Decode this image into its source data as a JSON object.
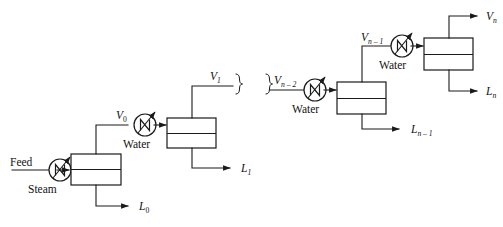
{
  "figure": {
    "kind": "process-flow-diagram",
    "width": 503,
    "height": 227,
    "background_color": "#ffffff",
    "line_color": "#1a1a1a",
    "liquid_fill_color": "#d6d6d6",
    "vessel_fill_color": "#ffffff"
  },
  "labels": {
    "feed": "Feed",
    "steam": "Steam",
    "water_1": "Water",
    "water_2": "Water",
    "water_3": "Water",
    "V0": "V",
    "V0_sub": "0",
    "V1": "V",
    "V1_sub": "1",
    "Vn2": "V",
    "Vn2_sub": "n – 2",
    "Vn1": "V",
    "Vn1_sub": "n – 1",
    "Vn": "V",
    "Vn_sub": "n",
    "L0": "L",
    "L0_sub": "0",
    "L1": "L",
    "L1_sub": "1",
    "Ln1": "L",
    "Ln1_sub": "n – 1",
    "Ln": "L",
    "Ln_sub": "n"
  },
  "streams": [
    {
      "id": "feed",
      "label": "Feed",
      "role": "inlet-liquid",
      "into": "heat-exchanger-steam"
    },
    {
      "id": "steam",
      "label": "Steam",
      "role": "heating-medium",
      "into": "heat-exchanger-steam"
    },
    {
      "id": "V0",
      "label": "V0",
      "role": "vapor-out",
      "from": "evaporator-1",
      "into": "heat-exchanger-1"
    },
    {
      "id": "L0",
      "label": "L0",
      "role": "liquid-out",
      "from": "evaporator-1"
    },
    {
      "id": "V1",
      "label": "V1",
      "role": "vapor-out",
      "from": "evaporator-2"
    },
    {
      "id": "L1",
      "label": "L1",
      "role": "liquid-out",
      "from": "evaporator-2"
    },
    {
      "id": "Vn2",
      "label": "Vn-2",
      "role": "vapor-in",
      "into": "heat-exchanger-2"
    },
    {
      "id": "Vn1",
      "label": "Vn-1",
      "role": "vapor-out",
      "from": "evaporator-3",
      "into": "heat-exchanger-3"
    },
    {
      "id": "Ln1",
      "label": "Ln-1",
      "role": "liquid-out",
      "from": "evaporator-3"
    },
    {
      "id": "Vn",
      "label": "Vn",
      "role": "vapor-out",
      "from": "evaporator-4"
    },
    {
      "id": "Ln",
      "label": "Ln",
      "role": "liquid-out",
      "from": "evaporator-4"
    }
  ],
  "units": [
    {
      "id": "heat-exchanger-steam",
      "type": "heat-exchanger",
      "medium": "Steam"
    },
    {
      "id": "evaporator-1",
      "type": "evaporator",
      "stage": "0"
    },
    {
      "id": "heat-exchanger-1",
      "type": "heat-exchanger",
      "medium": "Water"
    },
    {
      "id": "evaporator-2",
      "type": "evaporator",
      "stage": "1"
    },
    {
      "id": "heat-exchanger-2",
      "type": "heat-exchanger",
      "medium": "Water"
    },
    {
      "id": "evaporator-3",
      "type": "evaporator",
      "stage": "n - 1"
    },
    {
      "id": "heat-exchanger-3",
      "type": "heat-exchanger",
      "medium": "Water"
    },
    {
      "id": "evaporator-4",
      "type": "evaporator",
      "stage": "n"
    }
  ],
  "break_marks": {
    "count": 2,
    "meaning": "continuation of repeated stages"
  }
}
